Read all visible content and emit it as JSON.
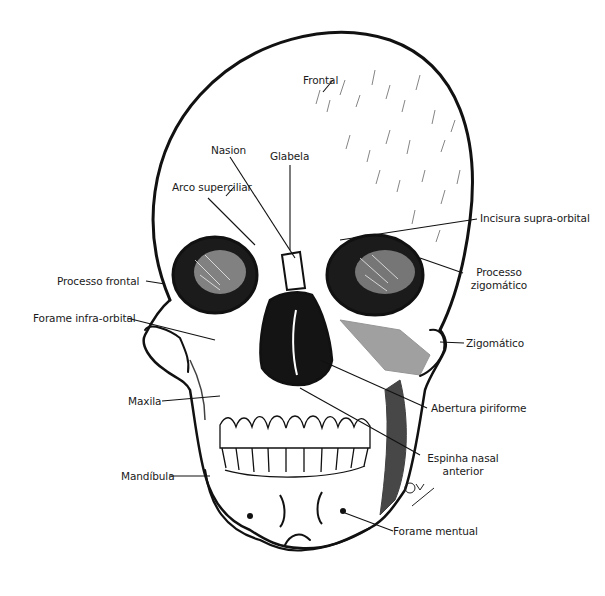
{
  "figure": {
    "labels": {
      "frontal": "Frontal",
      "nasion": "Nasion",
      "glabela": "Glabela",
      "arco_superciliar": "Arco superciliar",
      "incisura_supra_orbital": "Incisura supra-orbital",
      "processo_frontal": "Processo frontal",
      "processo_zigomatico_1": "Processo",
      "processo_zigomatico_2": "zigomático",
      "forame_infra_orbital": "Forame infra-orbital",
      "zigomatico": "Zigomático",
      "maxila": "Maxila",
      "abertura_piriforme": "Abertura piriforme",
      "espinha_nasal_1": "Espinha nasal",
      "espinha_nasal_2": "anterior",
      "mandibula": "Mandíbula",
      "forame_mentual": "Forame mentual"
    },
    "colors": {
      "ink": "#111111",
      "bone": "#ffffff",
      "text": "#1a1a1a"
    }
  }
}
